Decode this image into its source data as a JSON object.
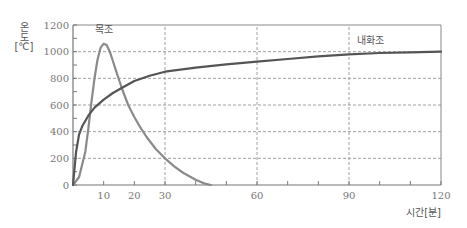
{
  "chart_data": {
    "type": "line",
    "title": "",
    "xlabel": "시간[분]",
    "ylabel": "온도[℃]",
    "ylabel_chars": [
      "온",
      "도",
      "[℃]"
    ],
    "xlim": [
      0,
      120
    ],
    "ylim": [
      0,
      1200
    ],
    "x_ticks": [
      10,
      20,
      30,
      60,
      90,
      120
    ],
    "x_minor_ticks": [
      10,
      20,
      30,
      40,
      50,
      60,
      70,
      80,
      90,
      100,
      110,
      120
    ],
    "y_ticks": [
      0,
      200,
      400,
      600,
      800,
      1000,
      1200
    ],
    "y_minor_ticks": [
      100,
      300,
      500,
      700,
      900,
      1100
    ],
    "grid": {
      "x_dashed": [
        30,
        60,
        90
      ],
      "y_dashed": [
        200,
        400,
        600,
        800,
        1000
      ]
    },
    "legend": "inline labels",
    "series": [
      {
        "name": "목조",
        "color": "#8a8a8a",
        "x": [
          0,
          2,
          4,
          5,
          6,
          7,
          8,
          9,
          10,
          11,
          12,
          13,
          14,
          16,
          18,
          20,
          22,
          24,
          27,
          30,
          33,
          36,
          40,
          43,
          45
        ],
        "y": [
          0,
          60,
          250,
          420,
          620,
          800,
          940,
          1030,
          1060,
          1050,
          1000,
          930,
          860,
          720,
          600,
          510,
          430,
          360,
          270,
          200,
          140,
          90,
          40,
          10,
          0
        ],
        "label_pos": {
          "x": 10,
          "y": 1140
        }
      },
      {
        "name": "내화조",
        "color": "#555555",
        "x": [
          0,
          1,
          2,
          3,
          5,
          7,
          10,
          13,
          16,
          20,
          25,
          30,
          40,
          50,
          60,
          70,
          80,
          90,
          100,
          110,
          120
        ],
        "y": [
          0,
          250,
          380,
          440,
          520,
          580,
          640,
          690,
          730,
          780,
          820,
          850,
          880,
          905,
          925,
          945,
          965,
          980,
          990,
          995,
          1000
        ],
        "label_pos": {
          "x": 97,
          "y": 1060
        }
      }
    ]
  }
}
